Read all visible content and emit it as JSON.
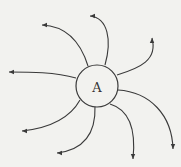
{
  "diagram": {
    "node": {
      "label": "A",
      "cx": 97,
      "cy": 86,
      "r": 21
    },
    "stroke_color": "#3a3a3a",
    "background": "#f2f2ef",
    "arrows": [
      {
        "name": "arrow-upper-left",
        "d": "M88,66 C80,40 65,26 42,25",
        "head": [
          42,
          25,
          -1,
          0
        ]
      },
      {
        "name": "arrow-top",
        "d": "M105,65 C112,40 108,18 90,16",
        "head": [
          90,
          16,
          -1,
          0
        ]
      },
      {
        "name": "arrow-upper-right",
        "d": "M117,75 C140,68 158,60 152,38",
        "head": [
          152,
          38,
          0,
          -1
        ]
      },
      {
        "name": "arrow-left",
        "d": "M76,78 C55,72 30,72 9,72",
        "head": [
          9,
          72,
          -1,
          0
        ]
      },
      {
        "name": "arrow-lower-left",
        "d": "M80,100 C70,118 50,128 22,131",
        "head": [
          22,
          131,
          -1,
          0
        ]
      },
      {
        "name": "arrow-bottom",
        "d": "M95,106 C96,135 82,150 57,153",
        "head": [
          57,
          153,
          -1,
          0
        ]
      },
      {
        "name": "arrow-lower-right",
        "d": "M110,104 C130,110 136,130 133,159",
        "head": [
          133,
          159,
          0,
          1
        ]
      },
      {
        "name": "arrow-right",
        "d": "M118,90 C150,92 172,115 173,149",
        "head": [
          173,
          149,
          0,
          1
        ]
      }
    ]
  }
}
